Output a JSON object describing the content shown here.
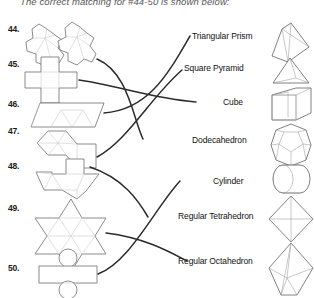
{
  "header": {
    "text": "The correct matching for #44-50 is shown below:"
  },
  "left_column": {
    "name": "net-diagrams",
    "items": [
      {
        "number": "44.",
        "net": "dodecahedron-net",
        "y": 24
      },
      {
        "number": "45.",
        "net": "cube-net",
        "y": 59
      },
      {
        "number": "46.",
        "net": "triangular-prism-net",
        "y": 99
      },
      {
        "number": "47.",
        "net": "regular-tetrahedron-net",
        "y": 126
      },
      {
        "number": "48.",
        "net": "square-pyramid-net",
        "y": 161
      },
      {
        "number": "49.",
        "net": "regular-octahedron-net",
        "y": 203
      },
      {
        "number": "50.",
        "net": "cylinder-net",
        "y": 263
      }
    ]
  },
  "right_column": {
    "name": "solid-names",
    "items": [
      {
        "label": "Triangular Prism",
        "solid": "triangular-prism",
        "y": 31
      },
      {
        "label": "Square Pyramid",
        "solid": "square-pyramid",
        "y": 63
      },
      {
        "label": "Cube",
        "solid": "cube",
        "y": 97
      },
      {
        "label": "Dodecahedron",
        "solid": "dodecahedron",
        "y": 135
      },
      {
        "label": "Cylinder",
        "solid": "cylinder",
        "y": 176
      },
      {
        "label": "Regular Tetrahedron",
        "solid": "regular-tetrahedron",
        "y": 211
      },
      {
        "label": "Regular Octahedron",
        "solid": "regular-octahedron",
        "y": 256
      }
    ]
  },
  "matching_lines": [
    {
      "from": "44.",
      "to": "Dodecahedron"
    },
    {
      "from": "45.",
      "to": "Cube"
    },
    {
      "from": "46.",
      "to": "Triangular Prism"
    },
    {
      "from": "47.",
      "to": "Square Pyramid"
    },
    {
      "from": "48.",
      "to": "Regular Tetrahedron"
    },
    {
      "from": "49.",
      "to": "Regular Octahedron"
    },
    {
      "from": "50.",
      "to": "Cylinder"
    }
  ],
  "colors": {
    "ink": "#1a1a1a",
    "line": "#2b2b2b",
    "shape_stroke": "#5a5a5a",
    "fold_line": "#c8c8c8",
    "background": "#ffffff"
  }
}
